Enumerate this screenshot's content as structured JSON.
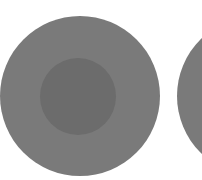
{
  "shapes": {
    "outer_left": {
      "cx": 80,
      "cy": 96,
      "r": 80,
      "color": "#7a7a7a"
    },
    "inner_left": {
      "cx": 78,
      "cy": 96,
      "r": 38,
      "color": "#6c6c6c"
    },
    "outer_right": {
      "cx": 257,
      "cy": 96,
      "r": 80,
      "color": "#7a7a7a"
    }
  },
  "background": "#ffffff"
}
